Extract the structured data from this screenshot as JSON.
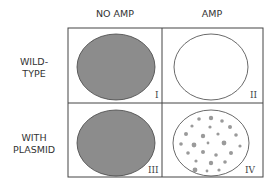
{
  "columns": [
    {
      "label": "NO AMP"
    },
    {
      "label": "AMP"
    }
  ],
  "rows": [
    {
      "label_line1": "WILD-",
      "label_line2": "TYPE"
    },
    {
      "label_line1": "WITH",
      "label_line2": "PLASMID"
    }
  ],
  "plates": [
    {
      "id": "I",
      "state": "lawn"
    },
    {
      "id": "II",
      "state": "empty"
    },
    {
      "id": "III",
      "state": "lawn"
    },
    {
      "id": "IV",
      "state": "colonies"
    }
  ],
  "colors": {
    "lawn": "#8c8c8c",
    "colony": "#9a9a9a",
    "line": "#444444"
  }
}
